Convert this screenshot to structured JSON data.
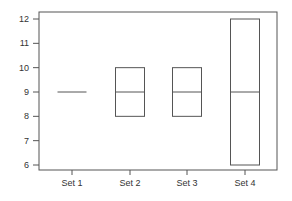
{
  "chart_data": {
    "type": "box",
    "title": "",
    "xlabel": "",
    "ylabel": "",
    "ylim": [
      5.75,
      12.3
    ],
    "yticks": [
      6,
      7,
      8,
      9,
      10,
      11,
      12
    ],
    "categories": [
      "Set 1",
      "Set 2",
      "Set 3",
      "Set 4"
    ],
    "boxes": [
      {
        "name": "Set 1",
        "q1": 9,
        "median": 9,
        "q3": 9
      },
      {
        "name": "Set 2",
        "q1": 8,
        "median": 9,
        "q3": 10
      },
      {
        "name": "Set 3",
        "q1": 8,
        "median": 9,
        "q3": 10
      },
      {
        "name": "Set 4",
        "q1": 6,
        "median": 9,
        "q3": 12
      }
    ],
    "grid": false,
    "legend": null
  }
}
